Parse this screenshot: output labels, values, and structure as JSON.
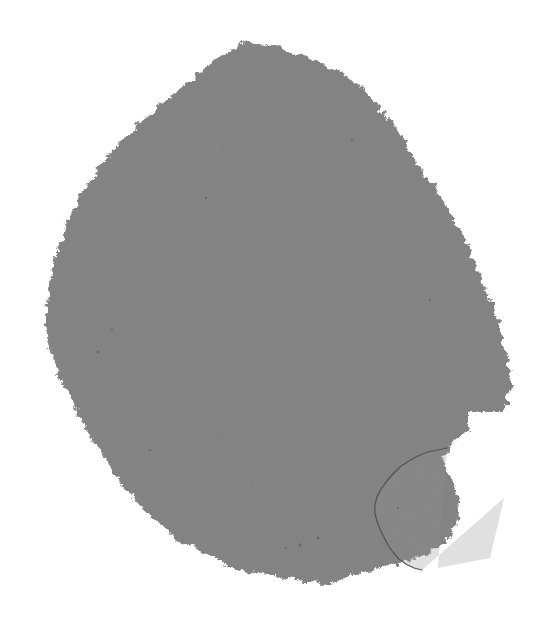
{
  "image": {
    "kind": "natural-image",
    "subject": "torn-gray-paper-fragment",
    "description": "A single large irregular piece of gray paper or card with ragged torn edges, photographed flat against a plain white background. A smaller sub-fragment is separated from the main body by a thin hairline crack at the lower right.",
    "width": 557,
    "height": 624,
    "orientation": "portrait"
  },
  "colors": {
    "background": "#ffffff",
    "paper_base": "#868686",
    "paper_light": "#909090",
    "paper_dark": "#7c7c7c",
    "edge_shadow": "#6f6f6f",
    "crack_line": "#4a4a4a",
    "speck": "#4f4f4f"
  },
  "geometry": {
    "main_body": {
      "name": "main-paper-mass",
      "apex": {
        "x": 252,
        "y": 42
      },
      "leftmost": {
        "x": 44,
        "y": 368
      },
      "rightmost": {
        "x": 511,
        "y": 384
      },
      "bottommost": {
        "x": 332,
        "y": 583
      },
      "outline": "M 252 42 L 262 46 L 276 44 L 290 52 L 305 56 L 318 62 L 330 68 L 342 72 L 352 82 L 360 88 L 368 94 L 374 104 L 382 110 L 390 120 L 396 130 L 404 140 L 410 150 L 416 160 L 422 170 L 428 178 L 434 188 L 440 196 L 446 206 L 452 214 L 456 224 L 462 232 L 466 242 L 470 252 L 474 262 L 478 272 L 482 282 L 486 292 L 490 302 L 494 312 L 498 322 L 501 332 L 504 342 L 506 352 L 508 362 L 510 372 L 511 382 L 510 392 L 508 400 L 505 408 L 500 416 L 494 422 L 488 426 L 482 430 L 476 432 L 470 430 L 464 434 L 458 440 L 452 444 L 446 450 L 444 458 L 446 468 L 450 478 L 454 488 L 458 498 L 460 508 L 458 518 L 454 528 L 448 538 L 440 546 L 430 552 L 418 558 L 406 562 L 394 564 L 382 566 L 370 570 L 358 574 L 346 578 L 334 582 L 322 583 L 310 582 L 298 580 L 286 578 L 274 576 L 262 574 L 250 572 L 238 568 L 226 564 L 214 558 L 202 552 L 190 546 L 178 540 L 168 532 L 158 524 L 148 514 L 138 504 L 130 494 L 122 484 L 114 472 L 106 460 L 98 448 L 90 436 L 84 424 L 78 412 L 72 400 L 66 388 L 60 376 L 56 364 L 52 352 L 48 340 L 46 328 L 45 316 L 46 304 L 48 292 L 50 280 L 52 268 L 56 256 L 60 244 L 64 232 L 68 220 L 74 208 L 80 196 L 88 184 L 96 172 L 104 160 L 114 148 L 124 138 L 134 128 L 146 118 L 158 108 L 170 98 L 182 88 L 194 78 L 206 68 L 218 58 L 230 50 L 241 44 Z"
    },
    "sub_fragment": {
      "name": "detached-corner-fragment",
      "top": {
        "x": 447,
        "y": 448
      },
      "left": {
        "x": 375,
        "y": 503
      },
      "right": {
        "x": 504,
        "y": 498
      },
      "bottom": {
        "x": 438,
        "y": 568
      },
      "crack_path": "M 447 448 L 438 450 L 428 452 L 418 456 L 409 461 L 400 467 L 393 474 L 387 481 L 381 489 L 377 497 L 375 505 L 375 513 L 377 521 L 380 529 L 384 537 L 388 545 L 393 552 L 399 559 L 406 564 L 414 568 L 422 570"
    },
    "notch": {
      "name": "white-notch-indent",
      "x": 470,
      "y": 428,
      "width": 22,
      "height": 28
    },
    "specks": [
      {
        "x": 300,
        "y": 545,
        "r": 1.6
      },
      {
        "x": 318,
        "y": 538,
        "r": 1.2
      },
      {
        "x": 286,
        "y": 548,
        "r": 1.0
      },
      {
        "x": 98,
        "y": 352,
        "r": 1.3
      },
      {
        "x": 112,
        "y": 330,
        "r": 1.0
      },
      {
        "x": 206,
        "y": 198,
        "r": 1.1
      },
      {
        "x": 430,
        "y": 300,
        "r": 1.0
      },
      {
        "x": 398,
        "y": 508,
        "r": 1.1
      },
      {
        "x": 150,
        "y": 450,
        "r": 1.0
      },
      {
        "x": 352,
        "y": 140,
        "r": 0.9
      }
    ]
  },
  "labels": {
    "scene": "torn-paper-scene",
    "main_body": "main-paper-mass",
    "fragment": "detached-corner-fragment",
    "crack": "hairline-crack",
    "background": "white-backdrop",
    "alt_text": "Torn gray paper fragment on white background"
  }
}
